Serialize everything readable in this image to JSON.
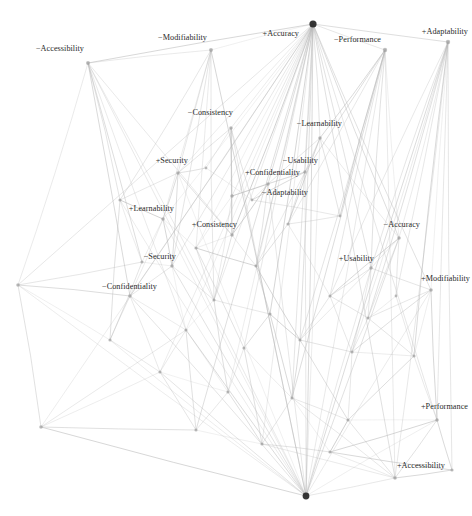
{
  "figure": {
    "type": "node-link-diagram",
    "title": "",
    "background_color": "#ffffff",
    "node_color": "#9a9a9a",
    "hub_color": "#2b2b2b",
    "edge_color": "#b9b9b9",
    "label_color": "#2a2a2a"
  },
  "chart_data": {
    "type": "scatter",
    "title": "",
    "xlabel": "",
    "ylabel": "",
    "grid": false,
    "legend": null,
    "labelled_nodes": [
      {
        "id": "n0",
        "label": "−Accessibility",
        "x": 88,
        "y": 63,
        "r": 2.0,
        "label_side": "left",
        "label_x": 84,
        "label_y": 49,
        "degree": 9
      },
      {
        "id": "n1",
        "label": "−Modifiability",
        "x": 211,
        "y": 50,
        "r": 2.0,
        "label_side": "left",
        "label_x": 207,
        "label_y": 38,
        "degree": 8
      },
      {
        "id": "n2",
        "label": "+Accuracy",
        "x": 313,
        "y": 24,
        "r": 3.6,
        "label_side": "left",
        "label_x": 299,
        "label_y": 34,
        "degree": 34
      },
      {
        "id": "n3",
        "label": "−Performance",
        "x": 385,
        "y": 50,
        "r": 2.2,
        "label_side": "left",
        "label_x": 381,
        "label_y": 40,
        "degree": 14
      },
      {
        "id": "n4",
        "label": "+Adaptability",
        "x": 448,
        "y": 42,
        "r": 2.2,
        "label_side": "left",
        "label_x": 468,
        "label_y": 32,
        "degree": 13
      },
      {
        "id": "n5",
        "label": "−Consistency",
        "x": 231,
        "y": 128,
        "r": 1.8,
        "label_side": "left",
        "label_x": 233,
        "label_y": 113,
        "degree": 7
      },
      {
        "id": "n6",
        "label": "−Learnability",
        "x": 320,
        "y": 138,
        "r": 1.8,
        "label_side": "left",
        "label_x": 342,
        "label_y": 124,
        "degree": 8
      },
      {
        "id": "n7",
        "label": "+Security",
        "x": 178,
        "y": 173,
        "r": 1.8,
        "label_side": "left",
        "label_x": 188,
        "label_y": 161,
        "degree": 8
      },
      {
        "id": "n8",
        "label": "−Usability",
        "x": 305,
        "y": 172,
        "r": 1.8,
        "label_side": "left",
        "label_x": 318,
        "label_y": 161,
        "degree": 9
      },
      {
        "id": "n9",
        "label": "+Confidentiality",
        "x": 268,
        "y": 184,
        "r": 1.8,
        "label_side": "left",
        "label_x": 300,
        "label_y": 173,
        "degree": 8
      },
      {
        "id": "n10",
        "label": "−Adaptability",
        "x": 232,
        "y": 196,
        "r": 1.8,
        "label_side": "left",
        "label_x": 308,
        "label_y": 193,
        "degree": 7
      },
      {
        "id": "n11",
        "label": "+Learnability",
        "x": 163,
        "y": 219,
        "r": 1.8,
        "label_side": "left",
        "label_x": 174,
        "label_y": 209,
        "degree": 8
      },
      {
        "id": "n12",
        "label": "+Consistency",
        "x": 232,
        "y": 235,
        "r": 1.8,
        "label_side": "left",
        "label_x": 237,
        "label_y": 225,
        "degree": 7
      },
      {
        "id": "n13",
        "label": "−Accuracy",
        "x": 399,
        "y": 238,
        "r": 1.8,
        "label_side": "left",
        "label_x": 420,
        "label_y": 225,
        "degree": 9
      },
      {
        "id": "n14",
        "label": "−Security",
        "x": 172,
        "y": 266,
        "r": 1.8,
        "label_side": "left",
        "label_x": 176,
        "label_y": 257,
        "degree": 7
      },
      {
        "id": "n15",
        "label": "+Usability",
        "x": 371,
        "y": 268,
        "r": 1.8,
        "label_side": "left",
        "label_x": 374,
        "label_y": 259,
        "degree": 9
      },
      {
        "id": "n16",
        "label": "+Modifiability",
        "x": 431,
        "y": 290,
        "r": 1.8,
        "label_side": "left",
        "label_x": 470,
        "label_y": 279,
        "degree": 8
      },
      {
        "id": "n17",
        "label": "−Confidentiality",
        "x": 130,
        "y": 296,
        "r": 1.8,
        "label_side": "left",
        "label_x": 157,
        "label_y": 287,
        "degree": 7
      },
      {
        "id": "n18",
        "label": "+Performance",
        "x": 437,
        "y": 420,
        "r": 1.8,
        "label_side": "left",
        "label_x": 468,
        "label_y": 407,
        "degree": 9
      },
      {
        "id": "n19",
        "label": "+Accessibility",
        "x": 395,
        "y": 478,
        "r": 1.8,
        "label_side": "left",
        "label_x": 445,
        "label_y": 466,
        "degree": 9
      }
    ],
    "unlabelled_nodes": [
      {
        "id": "u0",
        "x": 306,
        "y": 496,
        "r": 3.4
      },
      {
        "id": "u1",
        "x": 18,
        "y": 285,
        "r": 1.8
      },
      {
        "id": "u2",
        "x": 41,
        "y": 427,
        "r": 1.8
      },
      {
        "id": "u3",
        "x": 120,
        "y": 200,
        "r": 1.6
      },
      {
        "id": "u4",
        "x": 196,
        "y": 248,
        "r": 1.6
      },
      {
        "id": "u5",
        "x": 256,
        "y": 266,
        "r": 1.6
      },
      {
        "id": "u6",
        "x": 288,
        "y": 224,
        "r": 1.6
      },
      {
        "id": "u7",
        "x": 214,
        "y": 300,
        "r": 1.6
      },
      {
        "id": "u8",
        "x": 270,
        "y": 314,
        "r": 1.6
      },
      {
        "id": "u9",
        "x": 330,
        "y": 296,
        "r": 1.6
      },
      {
        "id": "u10",
        "x": 186,
        "y": 330,
        "r": 1.6
      },
      {
        "id": "u11",
        "x": 244,
        "y": 348,
        "r": 1.6
      },
      {
        "id": "u12",
        "x": 300,
        "y": 340,
        "r": 1.6
      },
      {
        "id": "u13",
        "x": 352,
        "y": 352,
        "r": 1.6
      },
      {
        "id": "u14",
        "x": 160,
        "y": 372,
        "r": 1.6
      },
      {
        "id": "u15",
        "x": 228,
        "y": 392,
        "r": 1.6
      },
      {
        "id": "u16",
        "x": 292,
        "y": 398,
        "r": 1.6
      },
      {
        "id": "u17",
        "x": 348,
        "y": 420,
        "r": 1.6
      },
      {
        "id": "u18",
        "x": 196,
        "y": 430,
        "r": 1.6
      },
      {
        "id": "u19",
        "x": 262,
        "y": 444,
        "r": 1.6
      },
      {
        "id": "u20",
        "x": 330,
        "y": 452,
        "r": 1.6
      },
      {
        "id": "u21",
        "x": 142,
        "y": 262,
        "r": 1.6
      },
      {
        "id": "u22",
        "x": 368,
        "y": 318,
        "r": 1.6
      },
      {
        "id": "u23",
        "x": 414,
        "y": 356,
        "r": 1.6
      },
      {
        "id": "u24",
        "x": 452,
        "y": 470,
        "r": 1.6
      },
      {
        "id": "u25",
        "x": 110,
        "y": 340,
        "r": 1.6
      },
      {
        "id": "u26",
        "x": 252,
        "y": 200,
        "r": 1.4
      },
      {
        "id": "u27",
        "x": 340,
        "y": 216,
        "r": 1.4
      },
      {
        "id": "u28",
        "x": 206,
        "y": 168,
        "r": 1.4
      },
      {
        "id": "u29",
        "x": 396,
        "y": 296,
        "r": 1.4
      }
    ],
    "edges": [
      [
        "n2",
        "n0"
      ],
      [
        "n2",
        "n1"
      ],
      [
        "n2",
        "n3"
      ],
      [
        "n2",
        "n4"
      ],
      [
        "n2",
        "n5"
      ],
      [
        "n2",
        "n6"
      ],
      [
        "n2",
        "n7"
      ],
      [
        "n2",
        "n8"
      ],
      [
        "n2",
        "n9"
      ],
      [
        "n2",
        "n10"
      ],
      [
        "n2",
        "n11"
      ],
      [
        "n2",
        "n12"
      ],
      [
        "n2",
        "n13"
      ],
      [
        "n2",
        "n14"
      ],
      [
        "n2",
        "n15"
      ],
      [
        "n2",
        "n16"
      ],
      [
        "n2",
        "n17"
      ],
      [
        "n2",
        "n18"
      ],
      [
        "n2",
        "n19"
      ],
      [
        "n2",
        "u0"
      ],
      [
        "n2",
        "u1"
      ],
      [
        "n2",
        "u2"
      ],
      [
        "n2",
        "u4"
      ],
      [
        "n2",
        "u5"
      ],
      [
        "n2",
        "u7"
      ],
      [
        "n2",
        "u8"
      ],
      [
        "n2",
        "u10"
      ],
      [
        "n2",
        "u11"
      ],
      [
        "n2",
        "u12"
      ],
      [
        "n2",
        "u14"
      ],
      [
        "n2",
        "u15"
      ],
      [
        "n2",
        "u16"
      ],
      [
        "n2",
        "u18"
      ],
      [
        "n2",
        "u19"
      ],
      [
        "u0",
        "n0"
      ],
      [
        "u0",
        "n1"
      ],
      [
        "u0",
        "n3"
      ],
      [
        "u0",
        "n4"
      ],
      [
        "u0",
        "n5"
      ],
      [
        "u0",
        "n6"
      ],
      [
        "u0",
        "n7"
      ],
      [
        "u0",
        "n8"
      ],
      [
        "u0",
        "n9"
      ],
      [
        "u0",
        "n11"
      ],
      [
        "u0",
        "n13"
      ],
      [
        "u0",
        "n14"
      ],
      [
        "u0",
        "n15"
      ],
      [
        "u0",
        "n16"
      ],
      [
        "u0",
        "n17"
      ],
      [
        "u0",
        "n18"
      ],
      [
        "u0",
        "n19"
      ],
      [
        "u0",
        "u1"
      ],
      [
        "u0",
        "u2"
      ],
      [
        "u0",
        "u3"
      ],
      [
        "u0",
        "u10"
      ],
      [
        "u0",
        "u14"
      ],
      [
        "u0",
        "u25"
      ],
      [
        "n0",
        "n1"
      ],
      [
        "n0",
        "u1"
      ],
      [
        "n0",
        "u3"
      ],
      [
        "n0",
        "u7"
      ],
      [
        "n0",
        "u10"
      ],
      [
        "n0",
        "u21"
      ],
      [
        "n0",
        "n12"
      ],
      [
        "n0",
        "n17"
      ],
      [
        "n1",
        "n7"
      ],
      [
        "n1",
        "n11"
      ],
      [
        "n1",
        "u4"
      ],
      [
        "n1",
        "u7"
      ],
      [
        "n1",
        "u3"
      ],
      [
        "n1",
        "n14"
      ],
      [
        "n3",
        "n6"
      ],
      [
        "n3",
        "n8"
      ],
      [
        "n3",
        "n13"
      ],
      [
        "n3",
        "n15"
      ],
      [
        "n3",
        "u6"
      ],
      [
        "n3",
        "u9"
      ],
      [
        "n3",
        "u12"
      ],
      [
        "n3",
        "u16"
      ],
      [
        "n3",
        "u27"
      ],
      [
        "n3",
        "n19"
      ],
      [
        "n4",
        "n13"
      ],
      [
        "n4",
        "n15"
      ],
      [
        "n4",
        "n16"
      ],
      [
        "n4",
        "n18"
      ],
      [
        "n4",
        "u9"
      ],
      [
        "n4",
        "u13"
      ],
      [
        "n4",
        "u22"
      ],
      [
        "n4",
        "u23"
      ],
      [
        "n4",
        "u29"
      ],
      [
        "n4",
        "n19"
      ],
      [
        "n4",
        "u24"
      ],
      [
        "n5",
        "n7"
      ],
      [
        "n5",
        "n10"
      ],
      [
        "n5",
        "n12"
      ],
      [
        "n5",
        "u26"
      ],
      [
        "n5",
        "u28"
      ],
      [
        "n6",
        "n8"
      ],
      [
        "n6",
        "n9"
      ],
      [
        "n6",
        "u6"
      ],
      [
        "n6",
        "u27"
      ],
      [
        "n6",
        "n13"
      ],
      [
        "n7",
        "n11"
      ],
      [
        "n7",
        "n12"
      ],
      [
        "n7",
        "n14"
      ],
      [
        "n7",
        "u3"
      ],
      [
        "n7",
        "u28"
      ],
      [
        "n8",
        "n9"
      ],
      [
        "n8",
        "n10"
      ],
      [
        "n8",
        "u5"
      ],
      [
        "n8",
        "u6"
      ],
      [
        "n8",
        "u26"
      ],
      [
        "n9",
        "n10"
      ],
      [
        "n9",
        "n12"
      ],
      [
        "n9",
        "u5"
      ],
      [
        "n9",
        "u26"
      ],
      [
        "n10",
        "n12"
      ],
      [
        "n10",
        "u4"
      ],
      [
        "n10",
        "u7"
      ],
      [
        "n11",
        "n14"
      ],
      [
        "n11",
        "n17"
      ],
      [
        "n11",
        "u3"
      ],
      [
        "n11",
        "u21"
      ],
      [
        "n11",
        "u4"
      ],
      [
        "n12",
        "u4"
      ],
      [
        "n12",
        "u5"
      ],
      [
        "n12",
        "u7"
      ],
      [
        "n13",
        "n15"
      ],
      [
        "n13",
        "u9"
      ],
      [
        "n13",
        "u22"
      ],
      [
        "n13",
        "u29"
      ],
      [
        "n14",
        "n17"
      ],
      [
        "n14",
        "u7"
      ],
      [
        "n14",
        "u10"
      ],
      [
        "n14",
        "u21"
      ],
      [
        "n15",
        "n16"
      ],
      [
        "n15",
        "u9"
      ],
      [
        "n15",
        "u12"
      ],
      [
        "n15",
        "u13"
      ],
      [
        "n15",
        "u22"
      ],
      [
        "n16",
        "u22"
      ],
      [
        "n16",
        "u23"
      ],
      [
        "n16",
        "n18"
      ],
      [
        "n16",
        "u13"
      ],
      [
        "n17",
        "u10"
      ],
      [
        "n17",
        "u25"
      ],
      [
        "n17",
        "u1"
      ],
      [
        "n17",
        "u14"
      ],
      [
        "n18",
        "n19"
      ],
      [
        "n18",
        "u17"
      ],
      [
        "n18",
        "u23"
      ],
      [
        "n18",
        "u20"
      ],
      [
        "n18",
        "u24"
      ],
      [
        "n19",
        "u17"
      ],
      [
        "n19",
        "u20"
      ],
      [
        "n19",
        "u16"
      ],
      [
        "n19",
        "u19"
      ],
      [
        "n19",
        "u24"
      ],
      [
        "u1",
        "u2"
      ],
      [
        "u1",
        "u25"
      ],
      [
        "u1",
        "u21"
      ],
      [
        "u2",
        "u14"
      ],
      [
        "u2",
        "u18"
      ],
      [
        "u2",
        "u10"
      ],
      [
        "u3",
        "u21"
      ],
      [
        "u3",
        "u25"
      ],
      [
        "u4",
        "u5"
      ],
      [
        "u4",
        "u7"
      ],
      [
        "u4",
        "u11"
      ],
      [
        "u5",
        "u8"
      ],
      [
        "u5",
        "u6"
      ],
      [
        "u5",
        "u12"
      ],
      [
        "u6",
        "u9"
      ],
      [
        "u6",
        "u27"
      ],
      [
        "u7",
        "u8"
      ],
      [
        "u7",
        "u10"
      ],
      [
        "u7",
        "u15"
      ],
      [
        "u8",
        "u11"
      ],
      [
        "u8",
        "u12"
      ],
      [
        "u8",
        "u16"
      ],
      [
        "u9",
        "u12"
      ],
      [
        "u9",
        "u13"
      ],
      [
        "u9",
        "u22"
      ],
      [
        "u10",
        "u14"
      ],
      [
        "u10",
        "u15"
      ],
      [
        "u10",
        "u18"
      ],
      [
        "u11",
        "u15"
      ],
      [
        "u11",
        "u16"
      ],
      [
        "u11",
        "u19"
      ],
      [
        "u12",
        "u13"
      ],
      [
        "u12",
        "u16"
      ],
      [
        "u12",
        "u17"
      ],
      [
        "u13",
        "u17"
      ],
      [
        "u13",
        "u23"
      ],
      [
        "u13",
        "u22"
      ],
      [
        "u14",
        "u18"
      ],
      [
        "u14",
        "u25"
      ],
      [
        "u14",
        "u15"
      ],
      [
        "u15",
        "u19"
      ],
      [
        "u15",
        "u18"
      ],
      [
        "u16",
        "u19"
      ],
      [
        "u16",
        "u20"
      ],
      [
        "u16",
        "u17"
      ],
      [
        "u17",
        "u20"
      ],
      [
        "u17",
        "u23"
      ],
      [
        "u18",
        "u19"
      ],
      [
        "u19",
        "u20"
      ],
      [
        "u20",
        "u24"
      ],
      [
        "u21",
        "u25"
      ],
      [
        "u22",
        "u29"
      ],
      [
        "u22",
        "u23"
      ],
      [
        "u26",
        "u28"
      ],
      [
        "u26",
        "u27"
      ],
      [
        "u29",
        "u23"
      ]
    ]
  }
}
